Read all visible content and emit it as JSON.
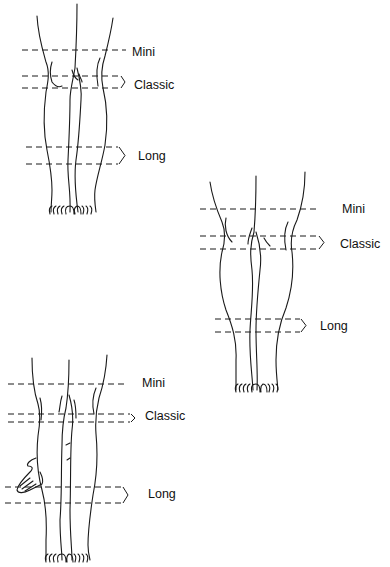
{
  "figures": [
    {
      "id": "figure-1",
      "labels": {
        "mini": "Mini",
        "classic": "Classic",
        "long": "Long"
      }
    },
    {
      "id": "figure-2",
      "labels": {
        "mini": "Mini",
        "classic": "Classic",
        "long": "Long"
      }
    },
    {
      "id": "figure-3",
      "labels": {
        "mini": "Mini",
        "classic": "Classic",
        "long": "Long"
      }
    }
  ],
  "colors": {
    "line": "#1a1a1a",
    "background": "#ffffff"
  }
}
